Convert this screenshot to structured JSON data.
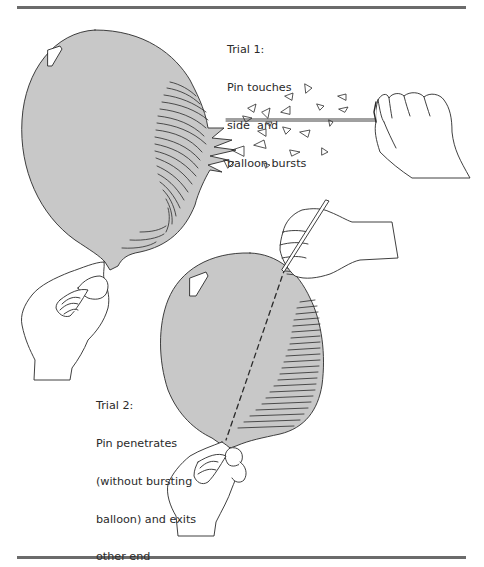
{
  "figure": {
    "colors": {
      "balloon_fill": "#c8c8c8",
      "line": "#2a2a2a",
      "rule": "#6b6b6b",
      "background": "#ffffff"
    },
    "trial1": {
      "title": "Trial 1:",
      "lines": [
        "Pin touches",
        "side  and",
        "balloon bursts"
      ]
    },
    "trial2": {
      "title": "Trial 2:",
      "lines": [
        "Pin penetrates",
        "(without bursting",
        "balloon) and exits",
        "other end"
      ]
    }
  }
}
